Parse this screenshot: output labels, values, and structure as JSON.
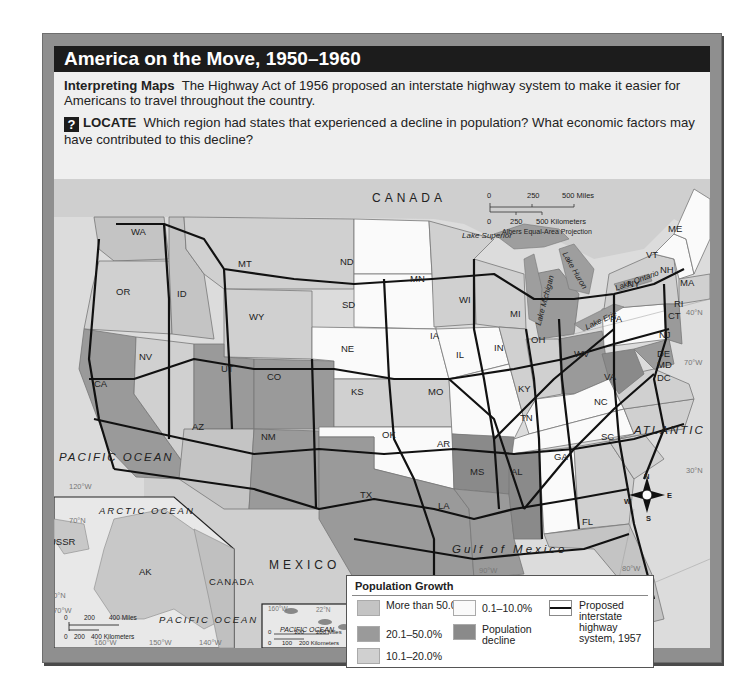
{
  "title": "America on the Move, 1950–1960",
  "intro": {
    "heading": "Interpreting Maps",
    "text": "The Highway Act of 1956 proposed an interstate highway system to make it easier for Americans to travel throughout the country.",
    "question_icon": "?",
    "question_label": "LOCATE",
    "question_text": "Which region had states that experienced a decline in population? What economic factors may have contributed to this decline?"
  },
  "colors": {
    "more_than_50": "#c4c4c4",
    "range_20_50": "#9a9a9a",
    "range_10_20": "#d0d0d0",
    "range_0_10": "#fafafa",
    "decline": "#8a8a8a",
    "water": "#dcdcdc",
    "foreign_land": "#cfcfcf",
    "highway": "#111111",
    "title_bar": "#1c1c1c"
  },
  "map": {
    "country_labels": [
      "CANADA",
      "MEXICO"
    ],
    "ocean_labels": {
      "pacific": "PACIFIC OCEAN",
      "atlantic": "ATLANTIC OCEAN",
      "gulf": "Gulf of Mexico"
    },
    "lakes": [
      "Lake Superior",
      "Lake Michigan",
      "Lake Huron",
      "Lake Ontario",
      "Lake Erie"
    ],
    "grid_labels": [
      "40°N",
      "30°N",
      "70°W",
      "80°W",
      "90°W",
      "120°W"
    ],
    "scale": {
      "miles": [
        "0",
        "250",
        "500 Miles"
      ],
      "km": [
        "0",
        "250",
        "500 Kilometers"
      ],
      "projection": "Albers Equal-Area Projection"
    },
    "compass": {
      "n": "N",
      "s": "S",
      "e": "E",
      "w": "W"
    },
    "states": {
      "WA": "WA",
      "OR": "OR",
      "CA": "CA",
      "NV": "NV",
      "ID": "ID",
      "MT": "MT",
      "WY": "WY",
      "UT": "UT",
      "CO": "CO",
      "AZ": "AZ",
      "NM": "NM",
      "ND": "ND",
      "SD": "SD",
      "NE": "NE",
      "KS": "KS",
      "OK": "OK",
      "TX": "TX",
      "MN": "MN",
      "IA": "IA",
      "MO": "MO",
      "AR": "AR",
      "LA": "LA",
      "WI": "WI",
      "IL": "IL",
      "MI": "MI",
      "IN": "IN",
      "OH": "OH",
      "KY": "KY",
      "TN": "TN",
      "MS": "MS",
      "AL": "AL",
      "GA": "GA",
      "FL": "FL",
      "SC": "SC",
      "NC": "NC",
      "VA": "VA",
      "WV": "WV",
      "PA": "PA",
      "NY": "NY",
      "VT": "VT",
      "NH": "NH",
      "ME": "ME",
      "MA": "MA",
      "RI": "RI",
      "CT": "CT",
      "NJ": "NJ",
      "DE": "DE",
      "MD": "MD",
      "DC": "DC"
    }
  },
  "alaska_inset": {
    "state": "AK",
    "labels": {
      "ocean_top": "ARCTIC OCEAN",
      "ocean_bottom": "PACIFIC OCEAN",
      "west": "USSR",
      "east": "CANADA"
    },
    "grid_labels": [
      "70°N",
      "60°N",
      "170°W",
      "160°W",
      "150°W",
      "140°W"
    ],
    "scale": {
      "miles": [
        "0",
        "200",
        "400 Miles"
      ],
      "km": [
        "0",
        "200",
        "400 Kilometers"
      ]
    }
  },
  "hawaii_inset": {
    "state": "HI",
    "ocean": "PACIFIC OCEAN",
    "grid_labels": [
      "160°W",
      "22°N",
      "155°W",
      "20°N"
    ],
    "scale": {
      "miles": [
        "0",
        "100",
        "200 Miles"
      ],
      "km": [
        "0",
        "100",
        "200 Kilometers"
      ]
    }
  },
  "legend": {
    "title": "Population Growth",
    "items": [
      {
        "label": "More than 50.0%",
        "color_key": "more_than_50"
      },
      {
        "label": "20.1–50.0%",
        "color_key": "range_20_50"
      },
      {
        "label": "10.1–20.0%",
        "color_key": "range_10_20"
      },
      {
        "label": "0.1–10.0%",
        "color_key": "range_0_10"
      },
      {
        "label": "Population decline",
        "color_key": "decline"
      }
    ],
    "highway_label": "Proposed interstate highway system, 1957"
  }
}
